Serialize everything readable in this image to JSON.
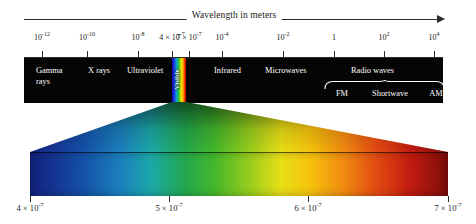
{
  "figure": {
    "title": "Wavelength in meters",
    "arrow_direction": "right"
  },
  "top_axis": {
    "label": "Wavelength in meters",
    "ticks": [
      {
        "mantissa": "10",
        "exponent": "-12",
        "x": 42
      },
      {
        "mantissa": "10",
        "exponent": "-10",
        "x": 87
      },
      {
        "mantissa": "10",
        "exponent": "-8",
        "x": 138
      },
      {
        "mantissa": "4 × 10",
        "exponent": "-7",
        "x": 172
      },
      {
        "mantissa": "7 × 10",
        "exponent": "-7",
        "x": 189
      },
      {
        "mantissa": "10",
        "exponent": "-4",
        "x": 222
      },
      {
        "mantissa": "10",
        "exponent": "-2",
        "x": 283
      },
      {
        "mantissa": "1",
        "exponent": "",
        "x": 334
      },
      {
        "mantissa": "10",
        "exponent": "2",
        "x": 384
      },
      {
        "mantissa": "10",
        "exponent": "4",
        "x": 434
      }
    ]
  },
  "band": {
    "background_color": "#050505",
    "text_color": "#ffffff",
    "regions": [
      {
        "name": "gamma-rays",
        "label_line1": "Gamma",
        "label_line2": "rays",
        "x": 12,
        "y": 8
      },
      {
        "name": "x-rays",
        "label_line1": "X rays",
        "label_line2": "",
        "x": 64,
        "y": 8
      },
      {
        "name": "ultraviolet",
        "label_line1": "Ultraviolet",
        "label_line2": "",
        "x": 103,
        "y": 8
      },
      {
        "name": "infrared",
        "label_line1": "Infrared",
        "label_line2": "",
        "x": 190,
        "y": 8
      },
      {
        "name": "microwaves",
        "label_line1": "Microwaves",
        "label_line2": "",
        "x": 241,
        "y": 8
      },
      {
        "name": "radio-waves",
        "label_line1": "Radio waves",
        "label_line2": "",
        "x": 327,
        "y": 8
      }
    ],
    "visible": {
      "label": "Visible",
      "x": 148,
      "width": 14
    },
    "radio_subbands": [
      {
        "label": "FM",
        "x": 318
      },
      {
        "label": "Shortwave",
        "x": 366
      },
      {
        "label": "AM",
        "x": 412
      }
    ]
  },
  "bottom_axis": {
    "ticks": [
      {
        "mantissa": "4 × 10",
        "exponent": "-7",
        "x": 30
      },
      {
        "mantissa": "5 × 10",
        "exponent": "-7",
        "x": 169
      },
      {
        "mantissa": "6 × 10",
        "exponent": "-7",
        "x": 308
      },
      {
        "mantissa": "7 × 10",
        "exponent": "-7",
        "x": 448
      }
    ]
  },
  "chart_data": {
    "type": "bar",
    "xlabel": "Wavelength in meters",
    "ylabel": "",
    "grid": false,
    "legend": "none",
    "scale": "log10",
    "axes": [
      {
        "name": "electromagnetic-spectrum-axis",
        "unit": "meters",
        "tick_labels": [
          "10^-12",
          "10^-10",
          "10^-8",
          "4 × 10^-7",
          "7 × 10^-7",
          "10^-4",
          "10^-2",
          "1",
          "10^2",
          "10^4"
        ],
        "tick_values": [
          1e-12,
          1e-10,
          1e-08,
          4e-07,
          7e-07,
          0.0001,
          0.01,
          1,
          100,
          10000
        ]
      },
      {
        "name": "visible-light-axis",
        "unit": "meters",
        "tick_labels": [
          "4 × 10^-7",
          "5 × 10^-7",
          "6 × 10^-7",
          "7 × 10^-7"
        ],
        "tick_values": [
          4e-07,
          5e-07,
          6e-07,
          7e-07
        ]
      }
    ],
    "categories": [
      "Gamma rays",
      "X rays",
      "Ultraviolet",
      "Visible",
      "Infrared",
      "Microwaves",
      "Radio waves"
    ],
    "series": [
      {
        "name": "wavelength-range-meters",
        "values": [
          {
            "region": "Gamma rays",
            "min": 1e-14,
            "max": 1e-11
          },
          {
            "region": "X rays",
            "min": 1e-11,
            "max": 1e-08
          },
          {
            "region": "Ultraviolet",
            "min": 1e-08,
            "max": 4e-07
          },
          {
            "region": "Visible",
            "min": 4e-07,
            "max": 7e-07
          },
          {
            "region": "Infrared",
            "min": 7e-07,
            "max": 0.001
          },
          {
            "region": "Microwaves",
            "min": 0.001,
            "max": 0.1
          },
          {
            "region": "Radio waves",
            "min": 0.1,
            "max": 10000.0
          }
        ]
      }
    ],
    "annotations": [
      {
        "text": "FM",
        "parent": "Radio waves"
      },
      {
        "text": "Shortwave",
        "parent": "Radio waves"
      },
      {
        "text": "AM",
        "parent": "Radio waves"
      }
    ]
  }
}
